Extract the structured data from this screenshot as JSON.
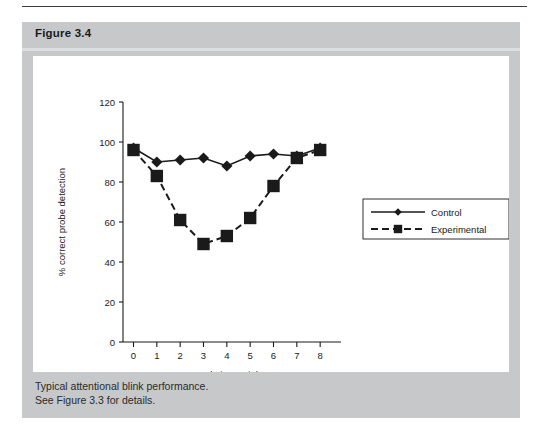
{
  "figure": {
    "title": "Figure 3.4",
    "caption_line1": "Typical attentional blink performance.",
    "caption_line2": "See Figure 3.3 for details."
  },
  "colors": {
    "frame_gray": "#c6c8ca",
    "header_sep": "#dcdee0",
    "plot_bg": "#ffffff",
    "ink": "#1a1a1a",
    "rule": "#3d3d3d"
  },
  "chart_data": {
    "type": "line",
    "title": "",
    "xlabel_line1": "Relative serial",
    "xlabel_line2": "position of probe",
    "ylabel": "% correct probe detection",
    "x": [
      0,
      1,
      2,
      3,
      4,
      5,
      6,
      7,
      8
    ],
    "xticklabels": [
      "0",
      "1",
      "2",
      "3",
      "4",
      "5",
      "6",
      "7",
      "8"
    ],
    "yticklabels": [
      "0",
      "20",
      "40",
      "60",
      "80",
      "100",
      "120"
    ],
    "yticks": [
      0,
      20,
      40,
      60,
      80,
      100,
      120
    ],
    "xlim": [
      -0.45,
      8.55
    ],
    "ylim": [
      0,
      120
    ],
    "grid": false,
    "legend_position": "center-right",
    "series": [
      {
        "name": "Control",
        "values": [
          97,
          90,
          91,
          92,
          88,
          93,
          94,
          93,
          97
        ],
        "marker": "diamond",
        "linestyle": "solid"
      },
      {
        "name": "Experimental",
        "values": [
          96,
          83,
          61,
          49,
          53,
          62,
          78,
          92,
          96
        ],
        "marker": "square",
        "linestyle": "dashed"
      }
    ]
  }
}
